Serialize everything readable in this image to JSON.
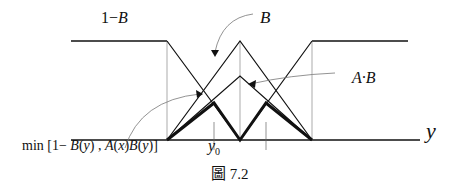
{
  "labels": {
    "one_minus_b": "1−B",
    "b": "B",
    "a_dot_b": "A·B",
    "min_expr": "min [1− B(y) , A(x)B(y)]",
    "y0": "y",
    "y0_sub": "0",
    "y_axis": "y",
    "caption": "圖  7.2"
  },
  "colors": {
    "line": "#111111",
    "thin": "#555555",
    "guide": "#888888"
  }
}
